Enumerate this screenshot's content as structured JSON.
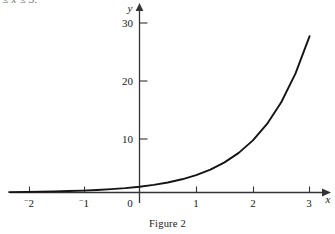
{
  "page": {
    "clipped_header_text": "≤ x ≤ 3.",
    "caption": "Figure 2",
    "background_color": "#ffffff",
    "ink_color": "#1a1a1a"
  },
  "chart_data": {
    "type": "line",
    "title": "",
    "subtitle": "",
    "xlabel": "x",
    "ylabel": "y",
    "function": "y = 3^x",
    "xlim": [
      -2.35,
      3.35
    ],
    "ylim": [
      -2,
      32
    ],
    "grid": false,
    "legend": null,
    "x_ticks": [
      -2,
      -1,
      0,
      1,
      2,
      3
    ],
    "x_tick_labels": [
      "⁻2",
      "⁻1",
      "0",
      "1",
      "2",
      "3"
    ],
    "y_ticks": [
      10,
      20,
      30
    ],
    "y_tick_labels": [
      "10",
      "20",
      "30"
    ],
    "axis_arrows": [
      "x-positive",
      "y-positive"
    ],
    "series": [
      {
        "name": "y = 3^x",
        "color": "#141414",
        "x": [
          -2.3,
          -2,
          -1.75,
          -1.5,
          -1.25,
          -1,
          -0.75,
          -0.5,
          -0.25,
          0,
          0.25,
          0.5,
          0.75,
          1,
          1.25,
          1.5,
          1.75,
          2,
          2.25,
          2.5,
          2.75,
          3
        ],
        "values": [
          0.07,
          0.11,
          0.15,
          0.19,
          0.25,
          0.33,
          0.44,
          0.58,
          0.76,
          1,
          1.32,
          1.73,
          2.28,
          3,
          3.95,
          5.2,
          6.84,
          9,
          11.84,
          15.59,
          20.52,
          27.0
        ]
      }
    ]
  },
  "axes": {
    "y_axis_label": "y",
    "x_axis_label": "x",
    "origin_label": "0"
  }
}
